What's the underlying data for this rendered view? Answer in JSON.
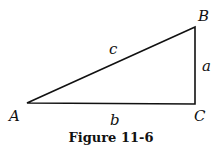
{
  "figure": {
    "caption": "Figure 11-6",
    "vertices": {
      "A": "A",
      "B": "B",
      "C": "C"
    },
    "sides": {
      "a": "a",
      "b": "b",
      "c": "c"
    },
    "line_color": "#111111"
  }
}
